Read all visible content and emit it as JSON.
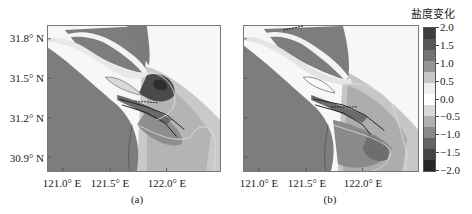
{
  "figure": {
    "colorbar": {
      "title": "盐度变化",
      "ticks": [
        "2.0",
        "1.5",
        "1.0",
        "0.5",
        "0.0",
        "−0.5",
        "−1.0",
        "−1.5",
        "−2.0"
      ],
      "bands": [
        "#3e3e3e",
        "#575757",
        "#737373",
        "#959595",
        "#c6c6c6",
        "#efefef",
        "#ffffff",
        "#d8d8d8",
        "#b0b0b0",
        "#8a8a8a",
        "#646464",
        "#444444",
        "#262626"
      ]
    },
    "panels": [
      {
        "id": "a",
        "caption": "(a)",
        "y_ticks": [
          "31.8° N",
          "31.5° N",
          "31.2° N",
          "30.9° N"
        ],
        "x_ticks": [
          "121.0° E",
          "121.5° E",
          "122.0° E"
        ]
      },
      {
        "id": "b",
        "caption": "(b)",
        "x_ticks": [
          "121.0° E",
          "121.5° E",
          "122.0° E"
        ]
      }
    ],
    "land_color": "#7d7d7d"
  }
}
